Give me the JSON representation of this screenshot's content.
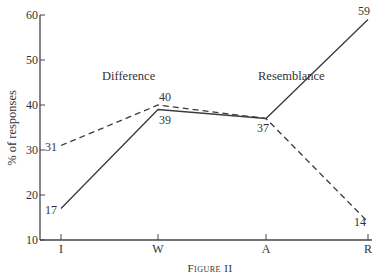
{
  "chart_data": {
    "type": "line",
    "title": "",
    "caption": "Figure II",
    "xlabel": "",
    "ylabel": "% of responses",
    "categories": [
      "I",
      "W",
      "A",
      "R"
    ],
    "ylim": [
      10,
      60
    ],
    "yticks": [
      10,
      20,
      30,
      40,
      50,
      60
    ],
    "grid": false,
    "series": [
      {
        "name": "Resemblance",
        "style": "solid",
        "values": [
          17,
          39,
          37,
          59
        ]
      },
      {
        "name": "Difference",
        "style": "dashed",
        "values": [
          31,
          40,
          37,
          14
        ]
      }
    ],
    "annotations": [
      {
        "text": "Difference",
        "near": "W"
      },
      {
        "text": "Resemblance",
        "near": "A"
      }
    ],
    "legend": "none (inline annotations)"
  },
  "labels": {
    "ylabel": "% of responses",
    "caption_main": "F",
    "caption_small": "IGURE",
    "caption_num": " II",
    "annot_difference": "Difference",
    "annot_resemblance": "Resemblance"
  }
}
